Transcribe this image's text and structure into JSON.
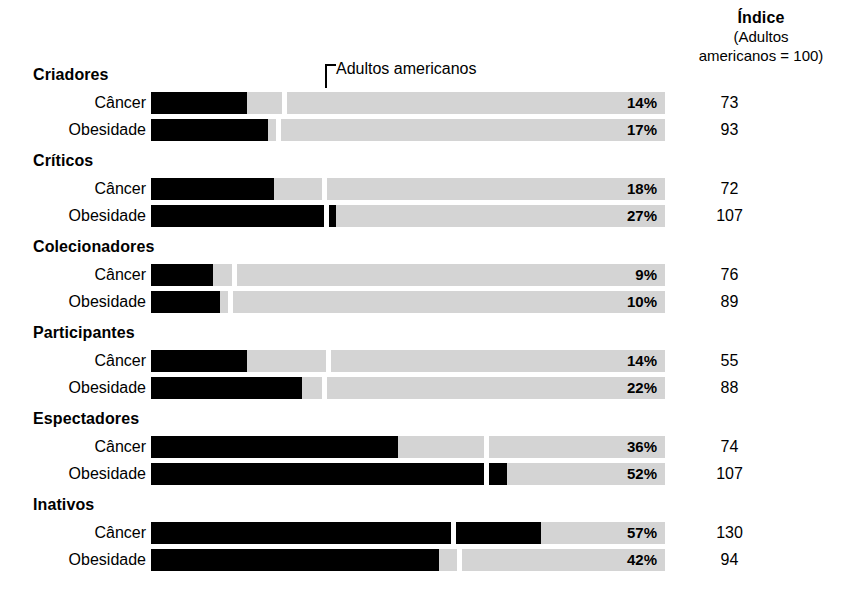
{
  "header": {
    "index_title": "Índice",
    "index_sub_line1": "(Adultos",
    "index_sub_line2": "americanos = 100)"
  },
  "reference": {
    "label": "Adultos americanos",
    "baseline_index": 100
  },
  "axis": {
    "scale_max_percent": 75,
    "track_left_px": 151,
    "track_width_px": 514
  },
  "chart_data": {
    "type": "bar",
    "title": "Índice (Adultos americanos = 100)",
    "xlabel": "",
    "ylabel": "",
    "grid": false,
    "legend_position": "top",
    "annotations": [
      "Adultos americanos"
    ],
    "categories": [
      "Criadores",
      "Críticos",
      "Colecionadores",
      "Participantes",
      "Espectadores",
      "Inativos"
    ],
    "measures": [
      "Câncer",
      "Obesidade"
    ],
    "series": [
      {
        "name": "Câncer",
        "values": [
          14,
          18,
          9,
          14,
          36,
          57
        ]
      },
      {
        "name": "Obesidade",
        "values": [
          17,
          27,
          10,
          22,
          52,
          42
        ]
      }
    ],
    "index_series": [
      {
        "name": "Câncer",
        "values": [
          73,
          72,
          76,
          55,
          74,
          130
        ]
      },
      {
        "name": "Obesidade",
        "values": [
          93,
          107,
          89,
          88,
          107,
          94
        ]
      }
    ]
  },
  "groups": [
    {
      "name": "Criadores",
      "rows": [
        {
          "label": "Câncer",
          "percent_text": "14%",
          "percent": 14,
          "index_text": "73",
          "index": 73,
          "fill_px": 96,
          "gap_px": 131
        },
        {
          "label": "Obesidade",
          "percent_text": "17%",
          "percent": 17,
          "index_text": "93",
          "index": 93,
          "fill_px": 117,
          "gap_px": 125
        }
      ]
    },
    {
      "name": "Críticos",
      "rows": [
        {
          "label": "Câncer",
          "percent_text": "18%",
          "percent": 18,
          "index_text": "72",
          "index": 72,
          "fill_px": 123,
          "gap_px": 171
        },
        {
          "label": "Obesidade",
          "percent_text": "27%",
          "percent": 27,
          "index_text": "107",
          "index": 107,
          "fill_px": 185,
          "gap_px": 173
        }
      ]
    },
    {
      "name": "Colecionadores",
      "rows": [
        {
          "label": "Câncer",
          "percent_text": "9%",
          "percent": 9,
          "index_text": "76",
          "index": 76,
          "fill_px": 62,
          "gap_px": 81
        },
        {
          "label": "Obesidade",
          "percent_text": "10%",
          "percent": 10,
          "index_text": "89",
          "index": 89,
          "fill_px": 69,
          "gap_px": 77
        }
      ]
    },
    {
      "name": "Participantes",
      "rows": [
        {
          "label": "Câncer",
          "percent_text": "14%",
          "percent": 14,
          "index_text": "55",
          "index": 55,
          "fill_px": 96,
          "gap_px": 175
        },
        {
          "label": "Obesidade",
          "percent_text": "22%",
          "percent": 22,
          "index_text": "88",
          "index": 88,
          "fill_px": 151,
          "gap_px": 171
        }
      ]
    },
    {
      "name": "Espectadores",
      "rows": [
        {
          "label": "Câncer",
          "percent_text": "36%",
          "percent": 36,
          "index_text": "74",
          "index": 74,
          "fill_px": 247,
          "gap_px": 333
        },
        {
          "label": "Obesidade",
          "percent_text": "52%",
          "percent": 52,
          "index_text": "107",
          "index": 107,
          "fill_px": 356,
          "gap_px": 333
        }
      ]
    },
    {
      "name": "Inativos",
      "rows": [
        {
          "label": "Câncer",
          "percent_text": "57%",
          "percent": 57,
          "index_text": "130",
          "index": 130,
          "fill_px": 390,
          "gap_px": 300
        },
        {
          "label": "Obesidade",
          "percent_text": "42%",
          "percent": 42,
          "index_text": "94",
          "index": 94,
          "fill_px": 288,
          "gap_px": 306
        }
      ]
    }
  ],
  "layout": {
    "group_head_y": [
      66,
      152,
      238,
      324,
      410,
      496
    ],
    "row_y": [
      92,
      119,
      178,
      205,
      264,
      291,
      350,
      377,
      436,
      463,
      522,
      549
    ],
    "ref_marker_x": 238
  }
}
